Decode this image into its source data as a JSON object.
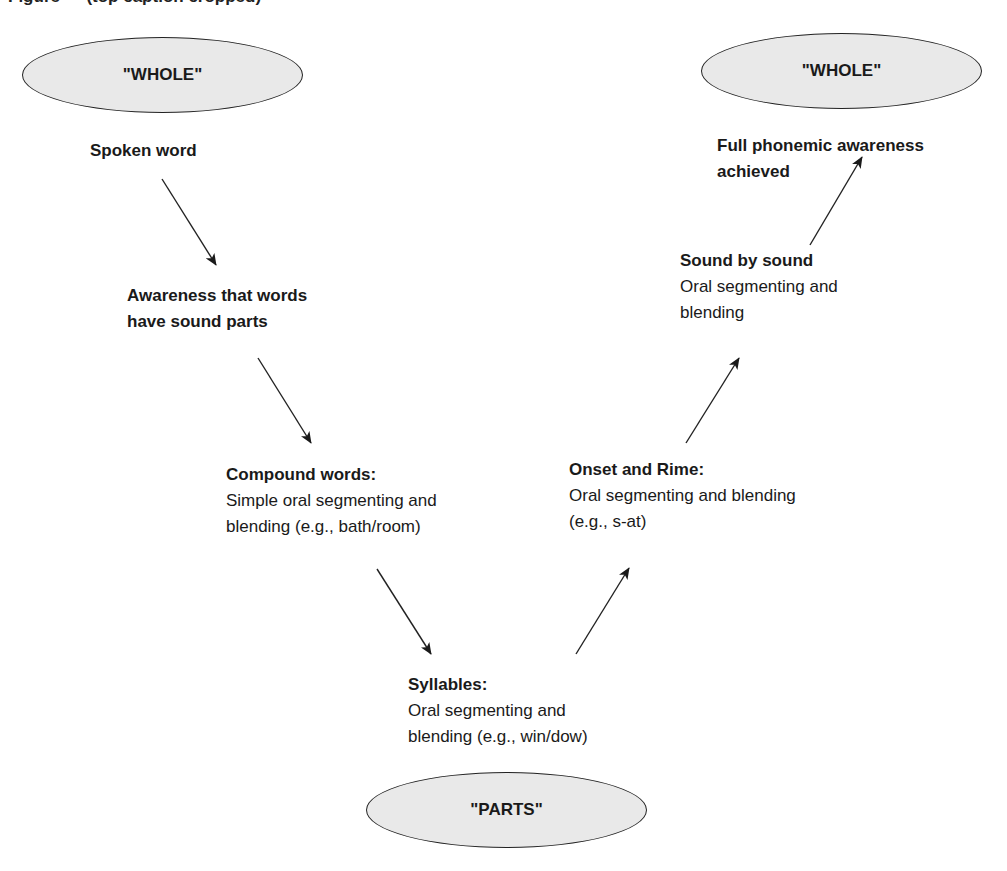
{
  "diagram": {
    "caption_partial": "Figure — (top caption cropped)",
    "colors": {
      "ellipse_fill": "#e9e9e9",
      "stroke": "#222222",
      "text": "#1a1a1a"
    },
    "nodes": {
      "whole_start": {
        "label": "\"WHOLE\""
      },
      "whole_end": {
        "label": "\"WHOLE\""
      },
      "parts": {
        "label": "\"PARTS\""
      },
      "spoken_word": {
        "title": "Spoken word"
      },
      "awareness": {
        "title_line1": "Awareness that words",
        "title_line2": "have sound parts"
      },
      "compound": {
        "title": "Compound words:",
        "desc_line1": "Simple oral segmenting and",
        "desc_line2": "blending (e.g., bath/room)"
      },
      "syllables": {
        "title": "Syllables:",
        "desc_line1": "Oral segmenting and",
        "desc_line2": "blending (e.g., win/dow)"
      },
      "onset_rime": {
        "title": "Onset and Rime:",
        "desc_line1": "Oral segmenting and blending",
        "desc_line2": "(e.g., s-at)"
      },
      "sound_by_sound": {
        "title": "Sound by sound",
        "desc_line1": "Oral segmenting and",
        "desc_line2": "blending"
      },
      "full_awareness": {
        "title_line1": "Full phonemic awareness",
        "title_line2": "achieved"
      }
    },
    "arrows": [
      {
        "from": "spoken_word",
        "to": "awareness",
        "x1": 162,
        "y1": 179,
        "x2": 216,
        "y2": 265
      },
      {
        "from": "awareness",
        "to": "compound",
        "x1": 258,
        "y1": 358,
        "x2": 311,
        "y2": 443
      },
      {
        "from": "compound",
        "to": "syllables",
        "x1": 377,
        "y1": 569,
        "x2": 431,
        "y2": 654
      },
      {
        "from": "syllables",
        "to": "onset_rime",
        "x1": 576,
        "y1": 654,
        "x2": 629,
        "y2": 568
      },
      {
        "from": "onset_rime",
        "to": "sound_by_sound",
        "x1": 686,
        "y1": 443,
        "x2": 739,
        "y2": 358
      },
      {
        "from": "sound_by_sound",
        "to": "full_awareness",
        "x1": 810,
        "y1": 245,
        "x2": 862,
        "y2": 157
      }
    ]
  }
}
